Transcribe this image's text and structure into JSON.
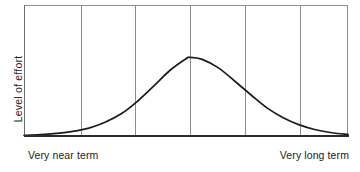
{
  "figure": {
    "background_color": "#ffffff",
    "frame_color": "#8d8d8d",
    "axis_color": "#2b2b2b",
    "curve_color": "#1c1c1c",
    "text_color": "#1c1c1c"
  },
  "axes": {
    "ylabel": "Level of effort",
    "xlabel_left": "Very near term",
    "xlabel_right": "Very long term"
  },
  "chart_data": {
    "type": "line",
    "title": "",
    "subtitle": "",
    "xlabel": "",
    "ylabel": "Level of effort",
    "x_axis_endpoint_labels": [
      "Very near term",
      "Very long term"
    ],
    "grid": true,
    "grid_axis": "x",
    "gridline_count": 5,
    "gridline_x_positions": [
      0.176,
      0.343,
      0.512,
      0.682,
      0.852
    ],
    "legend": null,
    "xlim": [
      0,
      1
    ],
    "ylim": [
      0,
      1
    ],
    "x_tick_labels": [],
    "y_tick_labels": [],
    "series": [
      {
        "name": "Level of effort",
        "shape": "bell-curve",
        "peak_x": 0.512,
        "peak_y": 0.6,
        "x": [
          0.0,
          0.05,
          0.1,
          0.15,
          0.2,
          0.25,
          0.3,
          0.35,
          0.4,
          0.45,
          0.5,
          0.512,
          0.55,
          0.6,
          0.65,
          0.7,
          0.75,
          0.8,
          0.85,
          0.9,
          0.95,
          1.0
        ],
        "values": [
          0.005,
          0.01,
          0.02,
          0.035,
          0.06,
          0.105,
          0.17,
          0.265,
          0.38,
          0.5,
          0.59,
          0.6,
          0.585,
          0.52,
          0.42,
          0.315,
          0.215,
          0.14,
          0.085,
          0.048,
          0.025,
          0.012
        ]
      }
    ]
  }
}
